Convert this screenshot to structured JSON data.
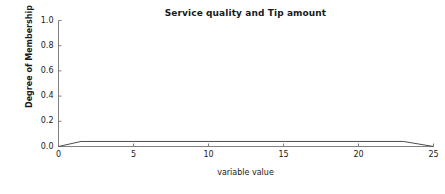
{
  "chart_data": {
    "type": "line",
    "title": "Service quality and Tip amount",
    "xlabel": "variable value",
    "ylabel": "Degree of Membership",
    "xlim": [
      0,
      25
    ],
    "ylim": [
      0,
      1
    ],
    "grid": false,
    "legend": null,
    "xticks": [
      "0",
      "5",
      "10",
      "15",
      "20",
      "25"
    ],
    "xtick_values": [
      0,
      5,
      10,
      15,
      20,
      25
    ],
    "yticks": [
      "0.0",
      "0.2",
      "0.4",
      "0.6",
      "0.8",
      "1.0"
    ],
    "ytick_values": [
      0.0,
      0.2,
      0.4,
      0.6,
      0.8,
      1.0
    ],
    "series": [
      {
        "name": "membership",
        "color": "#4d4d4d",
        "x": [
          0,
          1.5,
          23,
          25
        ],
        "values": [
          0,
          0.04,
          0.04,
          0
        ]
      }
    ]
  },
  "axes": {
    "spines": {
      "left_visible": "true",
      "bottom_visible": "true",
      "top_visible": "false",
      "right_visible": "false"
    },
    "tick_direction": "in",
    "axis_color": "#808080"
  },
  "colors": {
    "background": "#ffffff",
    "text": "#1a1a1a",
    "line": "#4d4d4d",
    "axis": "#808080"
  }
}
